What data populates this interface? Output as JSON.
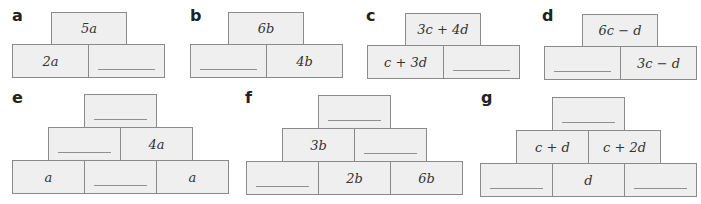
{
  "pyramids": [
    {
      "label": "a",
      "boxes": [
        {
          "row": 0,
          "text": "5a"
        },
        {
          "row": 1,
          "text": "2a"
        },
        {
          "row": 1,
          "text": ""
        }
      ]
    },
    {
      "label": "b",
      "boxes": [
        {
          "row": 0,
          "text": "6b"
        },
        {
          "row": 1,
          "text": ""
        },
        {
          "row": 1,
          "text": "4b"
        }
      ]
    },
    {
      "label": "c",
      "boxes": [
        {
          "row": 0,
          "text": "3c + 4d"
        },
        {
          "row": 1,
          "text": "c + 3d"
        },
        {
          "row": 1,
          "text": ""
        }
      ]
    },
    {
      "label": "d",
      "boxes": [
        {
          "row": 0,
          "text": "6c − d"
        },
        {
          "row": 1,
          "text": ""
        },
        {
          "row": 1,
          "text": "3c − d"
        }
      ]
    },
    {
      "label": "e",
      "boxes": [
        {
          "row": 0,
          "text": ""
        },
        {
          "row": 1,
          "text": ""
        },
        {
          "row": 1,
          "text": "4a"
        },
        {
          "row": 2,
          "text": "a"
        },
        {
          "row": 2,
          "text": ""
        },
        {
          "row": 2,
          "text": "a"
        }
      ]
    },
    {
      "label": "f",
      "boxes": [
        {
          "row": 0,
          "text": ""
        },
        {
          "row": 1,
          "text": "3b"
        },
        {
          "row": 1,
          "text": ""
        },
        {
          "row": 2,
          "text": ""
        },
        {
          "row": 2,
          "text": "2b"
        },
        {
          "row": 2,
          "text": "6b"
        }
      ]
    },
    {
      "label": "g",
      "boxes": [
        {
          "row": 0,
          "text": ""
        },
        {
          "row": 1,
          "text": "c + d"
        },
        {
          "row": 1,
          "text": "c + 2d"
        },
        {
          "row": 2,
          "text": ""
        },
        {
          "row": 2,
          "text": "d"
        },
        {
          "row": 2,
          "text": ""
        }
      ]
    }
  ]
}
